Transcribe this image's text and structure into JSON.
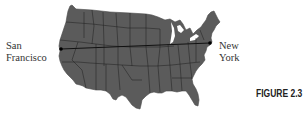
{
  "figure": {
    "label": "FIGURE 2.3"
  },
  "map": {
    "region": "Contiguous United States",
    "fill_color": "#5b5b5b",
    "border_color": "#1e1e1e",
    "route": {
      "from": "San Francisco",
      "to": "New York",
      "line_color": "#111111"
    },
    "cities": [
      {
        "name": "San Francisco",
        "line1": "San",
        "line2": "Francisco"
      },
      {
        "name": "New York",
        "line1": "New",
        "line2": "York"
      }
    ]
  }
}
